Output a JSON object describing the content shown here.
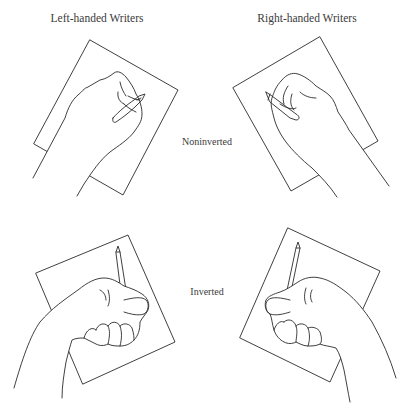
{
  "columns": {
    "left": {
      "title": "Left-handed Writers"
    },
    "right": {
      "title": "Right-handed Writers"
    }
  },
  "rows": {
    "top": {
      "label": "Noninverted"
    },
    "bottom": {
      "label": "Inverted"
    }
  },
  "panels": [
    {
      "id": "left-noninverted",
      "hand": "left",
      "grip": "noninverted",
      "icon": "hand-writing-icon"
    },
    {
      "id": "right-noninverted",
      "hand": "right",
      "grip": "noninverted",
      "icon": "hand-writing-icon"
    },
    {
      "id": "left-inverted",
      "hand": "left",
      "grip": "inverted",
      "icon": "hand-writing-icon"
    },
    {
      "id": "right-inverted",
      "hand": "right",
      "grip": "inverted",
      "icon": "hand-writing-icon"
    }
  ],
  "colors": {
    "ink": "#2a2a2a",
    "text": "#3a3a3a",
    "background": "#ffffff"
  }
}
